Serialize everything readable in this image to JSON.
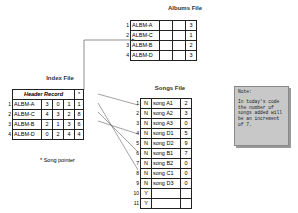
{
  "albums_file": {
    "title": "Albums File",
    "rows": [
      {
        "num": "1",
        "name": "ALBM-A",
        "ptr": "3"
      },
      {
        "num": "2",
        "name": "ALBM-C",
        "ptr": "1"
      },
      {
        "num": "3",
        "name": "ALBM-B",
        "ptr": "2"
      },
      {
        "num": "4",
        "name": "ALBM-D",
        "ptr": "3"
      }
    ]
  },
  "index_file": {
    "title": "Index File",
    "header_label": "Header Record",
    "header_star": "*",
    "rows": [
      {
        "num": "1",
        "name": "ALBM-A",
        "c1": "3",
        "c2": "0",
        "c3": "1",
        "ptr": "1"
      },
      {
        "num": "2",
        "name": "ALBM-C",
        "c1": "4",
        "c2": "3",
        "c3": "2",
        "ptr": "8"
      },
      {
        "num": "3",
        "name": "ALBM-B",
        "c1": "2",
        "c2": "1",
        "c3": "3",
        "ptr": "6"
      },
      {
        "num": "4",
        "name": "ALBM-D",
        "c1": "0",
        "c2": "2",
        "c3": "4",
        "ptr": "4"
      }
    ]
  },
  "songs_file": {
    "title": "Songs File",
    "rows": [
      {
        "num": "1",
        "flag": "N",
        "song": "song A1",
        "next": "2"
      },
      {
        "num": "2",
        "flag": "N",
        "song": "song A2",
        "next": "3"
      },
      {
        "num": "3",
        "flag": "N",
        "song": "song A3",
        "next": "0"
      },
      {
        "num": "4",
        "flag": "N",
        "song": "song D1",
        "next": "5"
      },
      {
        "num": "5",
        "flag": "N",
        "song": "song D2",
        "next": "9"
      },
      {
        "num": "6",
        "flag": "N",
        "song": "song B1",
        "next": "7"
      },
      {
        "num": "7",
        "flag": "N",
        "song": "song B2",
        "next": "0"
      },
      {
        "num": "8",
        "flag": "N",
        "song": "song C1",
        "next": "0"
      },
      {
        "num": "9",
        "flag": "N",
        "song": "song D3",
        "next": "0"
      },
      {
        "num": "10",
        "flag": "Y",
        "song": "",
        "next": ""
      },
      {
        "num": "11",
        "flag": "Y",
        "song": "",
        "next": ""
      }
    ]
  },
  "legend": {
    "text": "* Song pointer"
  },
  "note": {
    "title": "Note:",
    "body": "In today's code the number of songs added will be an increment of 7."
  }
}
